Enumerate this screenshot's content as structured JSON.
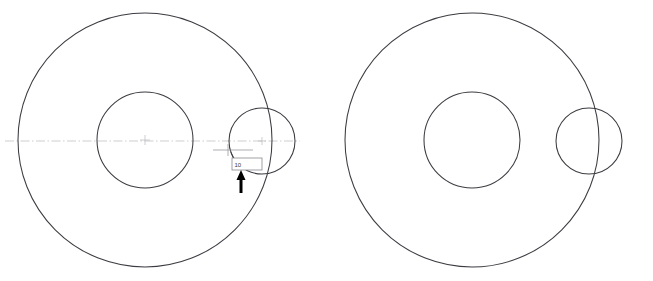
{
  "drawing": {
    "title": "CAD circle geometry - two views",
    "background_color": "#ffffff",
    "line_color": "#3c3c42",
    "centerline_color": "#b9b9bd",
    "annotation_color": "#9a9a9e",
    "arrow_color": "#000000",
    "textbox_fill": "#ffffff",
    "textbox_border": "#8a8a8e"
  },
  "views": [
    {
      "name": "left-view",
      "label": "Left view with dimension input",
      "circles": [
        {
          "name": "outer-circle",
          "cx": 145,
          "cy": 140,
          "r": 127
        },
        {
          "name": "inner-circle",
          "cx": 145,
          "cy": 140,
          "r": 48
        },
        {
          "name": "small-circle",
          "cx": 262,
          "cy": 141,
          "r": 33
        }
      ],
      "centerline": {
        "x1": 5,
        "y1": 141,
        "x2": 300,
        "y2": 141
      },
      "center_marks": [
        {
          "name": "center-mark-main",
          "cx": 145,
          "cy": 140,
          "size": 5
        },
        {
          "name": "center-mark-small",
          "cx": 262,
          "cy": 141,
          "size": 4
        }
      ]
    },
    {
      "name": "right-view",
      "label": "Right view plain geometry",
      "circles": [
        {
          "name": "outer-circle",
          "cx": 472,
          "cy": 140,
          "r": 127
        },
        {
          "name": "inner-circle",
          "cx": 472,
          "cy": 140,
          "r": 48
        },
        {
          "name": "small-circle",
          "cx": 589,
          "cy": 141,
          "r": 33
        }
      ]
    }
  ],
  "annotation": {
    "name": "dimension-input",
    "value": "10",
    "placeholder": "10",
    "dimension_line": {
      "x1": 213,
      "y1": 150,
      "x2": 253,
      "y2": 150
    },
    "extension_tick": {
      "x": 228,
      "y1": 144,
      "y2": 156
    },
    "leader": {
      "x1": 231,
      "y1": 152,
      "x2": 239,
      "y2": 166
    },
    "textbox": {
      "x": 232,
      "y": 158,
      "w": 30,
      "h": 12
    },
    "arrow": {
      "name": "pointer-arrow",
      "tip_x": 241,
      "tip_y": 170,
      "tail_y": 193,
      "shaft_width": 3,
      "head_width": 9,
      "head_height": 10
    }
  }
}
